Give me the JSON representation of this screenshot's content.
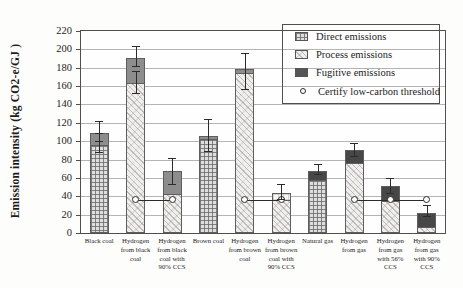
{
  "figure": {
    "ylabel": "Emission intensity (kg CO2-e/GJ )"
  },
  "legend": {
    "items": [
      {
        "label": "Direct emissions",
        "swatch": "direct"
      },
      {
        "label": "Process emissions",
        "swatch": "process"
      },
      {
        "label": "Fugitive emissions",
        "swatch": "fugitive"
      },
      {
        "label": "Certify low-carbon threshold",
        "swatch": "threshold-marker"
      }
    ]
  },
  "chart_data": {
    "type": "bar",
    "stacked": true,
    "title": "",
    "xlabel": "",
    "ylabel": "Emission intensity (kg CO2-e/GJ )",
    "ylim": [
      0,
      220
    ],
    "ytick_step": 20,
    "grid": true,
    "legend_position": "top-right",
    "categories": [
      "Black coal",
      "Hydrogen from black coal",
      "Hydrogen from black coal with 90% CCS",
      "Brown coal",
      "Hydrogen from brown coal",
      "Hydrogen from brown coal with 90% CCS",
      "Natural gas",
      "Hydrogen from gas",
      "Hydrogen from gas with 56% CCS",
      "Hydrogen from gas with 90% CCS"
    ],
    "bars": [
      {
        "category": "Black coal",
        "tick_label": "Black coal",
        "segments": [
          {
            "name": "Direct emissions",
            "value": 96,
            "pattern": "direct"
          },
          {
            "name": "Fugitive emissions",
            "value": 14,
            "pattern": "fugitive_coal"
          }
        ],
        "total": 110,
        "error_bars": [
          {
            "lo": 88,
            "hi": 109
          },
          {
            "lo": 100,
            "hi": 122
          }
        ]
      },
      {
        "category": "Hydrogen from black coal",
        "tick_label": "Hydrogen\nfrom black\ncoal",
        "segments": [
          {
            "name": "Process emissions",
            "value": 163,
            "pattern": "process"
          },
          {
            "name": "Fugitive emissions",
            "value": 29,
            "pattern": "fugitive_coal"
          }
        ],
        "total": 192,
        "error_bars": [
          {
            "lo": 153,
            "hi": 176
          },
          {
            "lo": 182,
            "hi": 204
          }
        ]
      },
      {
        "category": "Hydrogen from black coal with 90% CCS",
        "tick_label": "Hydrogen\nfrom black\ncoal with\n90% CCS",
        "segments": [
          {
            "name": "Process emissions",
            "value": 42,
            "pattern": "process"
          },
          {
            "name": "Fugitive emissions",
            "value": 27,
            "pattern": "fugitive_coal"
          }
        ],
        "total": 69,
        "error_bars": [
          {
            "lo": 53,
            "hi": 82
          }
        ]
      },
      {
        "category": "Brown coal",
        "tick_label": "Brown coal",
        "segments": [
          {
            "name": "Direct emissions",
            "value": 102,
            "pattern": "direct"
          },
          {
            "name": "Fugitive emissions",
            "value": 5,
            "pattern": "fugitive_coal"
          }
        ],
        "total": 107,
        "error_bars": [
          {
            "lo": 89,
            "hi": 124
          }
        ]
      },
      {
        "category": "Hydrogen from brown coal",
        "tick_label": "Hydrogen\nfrom brown\ncoal",
        "segments": [
          {
            "name": "Process emissions",
            "value": 174,
            "pattern": "process"
          },
          {
            "name": "Fugitive emissions",
            "value": 6,
            "pattern": "fugitive_coal"
          }
        ],
        "total": 180,
        "error_bars": [
          {
            "lo": 157,
            "hi": 196
          }
        ]
      },
      {
        "category": "Hydrogen from brown coal with 90% CCS",
        "tick_label": "Hydrogen\nfrom brown\ncoal with\n90% CCS",
        "segments": [
          {
            "name": "Process emissions",
            "value": 36,
            "pattern": "process"
          },
          {
            "name": "Direct emissions",
            "value": 9,
            "pattern": "direct_light"
          }
        ],
        "total": 45,
        "error_bars": [
          {
            "lo": 37,
            "hi": 53
          }
        ]
      },
      {
        "category": "Natural gas",
        "tick_label": "Natural gas",
        "segments": [
          {
            "name": "Direct emissions",
            "value": 58,
            "pattern": "direct"
          },
          {
            "name": "Fugitive emissions",
            "value": 11,
            "pattern": "fugitive_gas"
          }
        ],
        "total": 69,
        "error_bars": [
          {
            "lo": 64,
            "hi": 75
          }
        ]
      },
      {
        "category": "Hydrogen from gas",
        "tick_label": "Hydrogen\nfrom gas",
        "segments": [
          {
            "name": "Process emissions",
            "value": 76,
            "pattern": "process"
          },
          {
            "name": "Fugitive emissions",
            "value": 15,
            "pattern": "fugitive_gas"
          }
        ],
        "total": 91,
        "error_bars": [
          {
            "lo": 84,
            "hi": 98
          }
        ]
      },
      {
        "category": "Hydrogen from gas with 56% CCS",
        "tick_label": "Hydrogen\nfrom gas\nwith 56%\nCCS",
        "segments": [
          {
            "name": "Process emissions",
            "value": 35,
            "pattern": "process"
          },
          {
            "name": "Fugitive emissions",
            "value": 17,
            "pattern": "fugitive_gas"
          }
        ],
        "total": 52,
        "error_bars": [
          {
            "lo": 44,
            "hi": 60
          }
        ]
      },
      {
        "category": "Hydrogen from gas with 90% CCS",
        "tick_label": "Hydrogen\nfrom gas\nwith 90%\nCCS",
        "segments": [
          {
            "name": "Process emissions",
            "value": 7,
            "pattern": "process"
          },
          {
            "name": "Fugitive emissions",
            "value": 16,
            "pattern": "fugitive_gas"
          }
        ],
        "total": 23,
        "error_bars": [
          {
            "lo": 18,
            "hi": 31
          }
        ]
      }
    ],
    "threshold": {
      "label": "Certify low-carbon threshold",
      "value": 36.4,
      "line_groups": [
        [
          1,
          2
        ],
        [
          4,
          5
        ],
        [
          7,
          9
        ]
      ],
      "marker_indices": [
        1,
        2,
        4,
        5,
        7,
        8,
        9
      ]
    },
    "colors": {
      "fugitive_coal": "#8d8d8d",
      "fugitive_gas": "#474747",
      "axis": "#4f4f4f",
      "grid": "#b4b4b4",
      "error": "#2b2b2b"
    }
  }
}
